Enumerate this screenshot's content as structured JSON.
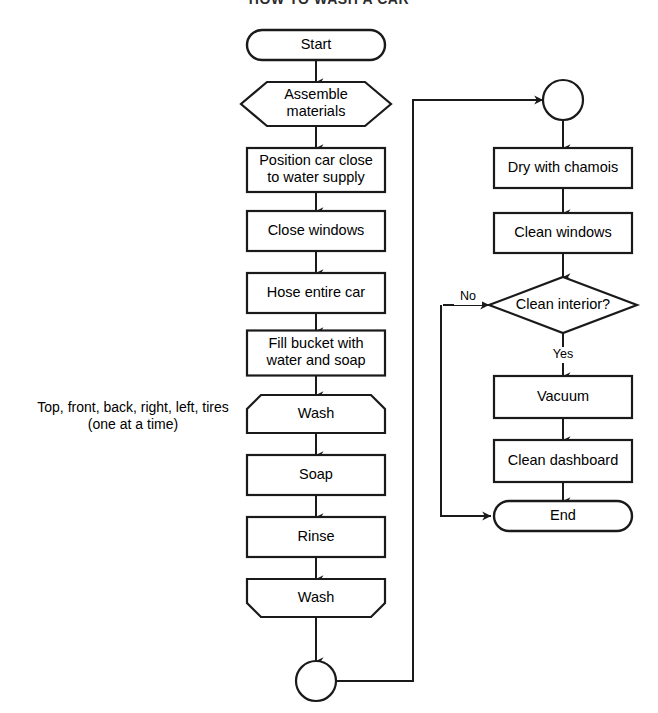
{
  "diagram": {
    "title": "HOW TO WASH A CAR",
    "title_x": 329,
    "title_y": 3,
    "canvas": {
      "width": 658,
      "height": 713
    },
    "stroke_color": "#1a1a1a",
    "fill_color": "#ffffff",
    "text_color": "#000000"
  },
  "annotation": {
    "line1": "Top, front, back, right, left, tires",
    "line2": "(one at a time)",
    "x": 133,
    "y1": 407,
    "y2": 424
  },
  "nodes": [
    {
      "id": "start",
      "type": "terminator",
      "label": "Start",
      "cx": 316,
      "cy": 45,
      "w": 138,
      "h": 30
    },
    {
      "id": "assemble",
      "type": "hexagon",
      "label": "Assemble|materials",
      "cx": 316,
      "cy": 104,
      "w": 150,
      "h": 44
    },
    {
      "id": "position",
      "type": "process",
      "label": "Position car close|to water supply",
      "cx": 316,
      "cy": 170,
      "w": 138,
      "h": 44
    },
    {
      "id": "closewin",
      "type": "process",
      "label": "Close windows",
      "cx": 316,
      "cy": 231,
      "w": 138,
      "h": 40
    },
    {
      "id": "hose",
      "type": "process",
      "label": "Hose entire car",
      "cx": 316,
      "cy": 293,
      "w": 138,
      "h": 40
    },
    {
      "id": "fillbucket",
      "type": "process",
      "label": "Fill bucket with|water and soap",
      "cx": 316,
      "cy": 353,
      "w": 138,
      "h": 45
    },
    {
      "id": "wash1",
      "type": "chamfer-top",
      "label": "Wash",
      "cx": 316,
      "cy": 414,
      "w": 138,
      "h": 38
    },
    {
      "id": "soap",
      "type": "process",
      "label": "Soap",
      "cx": 316,
      "cy": 475,
      "w": 138,
      "h": 40
    },
    {
      "id": "rinse",
      "type": "process",
      "label": "Rinse",
      "cx": 316,
      "cy": 537,
      "w": 138,
      "h": 40
    },
    {
      "id": "wash2",
      "type": "chamfer-bot",
      "label": "Wash",
      "cx": 316,
      "cy": 598,
      "w": 138,
      "h": 38
    },
    {
      "id": "connA",
      "type": "connector",
      "label": "",
      "cx": 316,
      "cy": 681,
      "w": 40,
      "h": 40
    },
    {
      "id": "connB",
      "type": "connector",
      "label": "",
      "cx": 563,
      "cy": 100,
      "w": 40,
      "h": 40
    },
    {
      "id": "drychamois",
      "type": "process",
      "label": "Dry with chamois",
      "cx": 563,
      "cy": 168,
      "w": 138,
      "h": 40
    },
    {
      "id": "cleanwin",
      "type": "process",
      "label": "Clean windows",
      "cx": 563,
      "cy": 233,
      "w": 138,
      "h": 40
    },
    {
      "id": "cleanint",
      "type": "decision",
      "label": "Clean interior?",
      "cx": 563,
      "cy": 305,
      "w": 148,
      "h": 56
    },
    {
      "id": "vacuum",
      "type": "process",
      "label": "Vacuum",
      "cx": 563,
      "cy": 397,
      "w": 138,
      "h": 42
    },
    {
      "id": "cleandash",
      "type": "process",
      "label": "Clean dashboard",
      "cx": 563,
      "cy": 461,
      "w": 138,
      "h": 42
    },
    {
      "id": "end",
      "type": "terminator",
      "label": "End",
      "cx": 563,
      "cy": 516,
      "w": 138,
      "h": 30
    }
  ],
  "edges": [
    {
      "id": "e-start-assemble",
      "from": "start",
      "to": "assemble",
      "points": "316,60 316,82",
      "arrow": "down",
      "label": ""
    },
    {
      "id": "e-assemble-position",
      "from": "assemble",
      "to": "position",
      "points": "316,126 316,148",
      "arrow": "down",
      "label": ""
    },
    {
      "id": "e-position-closewin",
      "from": "position",
      "to": "closewin",
      "points": "316,192 316,211",
      "arrow": "down",
      "label": ""
    },
    {
      "id": "e-closewin-hose",
      "from": "closewin",
      "to": "hose",
      "points": "316,251 316,273",
      "arrow": "down",
      "label": ""
    },
    {
      "id": "e-hose-fillbucket",
      "from": "hose",
      "to": "fillbucket",
      "points": "316,313 316,331",
      "arrow": "down",
      "label": ""
    },
    {
      "id": "e-fillbucket-wash1",
      "from": "fillbucket",
      "to": "wash1",
      "points": "316,376 316,395",
      "arrow": "down",
      "label": ""
    },
    {
      "id": "e-wash1-soap",
      "from": "wash1",
      "to": "soap",
      "points": "316,433 316,455",
      "arrow": "down",
      "label": ""
    },
    {
      "id": "e-soap-rinse",
      "from": "soap",
      "to": "rinse",
      "points": "316,495 316,517",
      "arrow": "down",
      "label": ""
    },
    {
      "id": "e-rinse-wash2",
      "from": "rinse",
      "to": "wash2",
      "points": "316,557 316,579",
      "arrow": "down",
      "label": ""
    },
    {
      "id": "e-wash2-connA",
      "from": "wash2",
      "to": "connA",
      "points": "316,617 316,661",
      "arrow": "down",
      "label": ""
    },
    {
      "id": "e-connA-connB",
      "from": "connA",
      "to": "connB",
      "points": "336,681 413,681 413,100 543,100",
      "arrow": "right",
      "label": ""
    },
    {
      "id": "e-connB-drychamois",
      "from": "connB",
      "to": "drychamois",
      "points": "563,120 563,148",
      "arrow": "down",
      "label": ""
    },
    {
      "id": "e-drychamois-cleanwin",
      "from": "drychamois",
      "to": "cleanwin",
      "points": "563,188 563,213",
      "arrow": "down",
      "label": ""
    },
    {
      "id": "e-cleanwin-cleanint",
      "from": "cleanwin",
      "to": "cleanint",
      "points": "563,253 563,277",
      "arrow": "down",
      "label": ""
    },
    {
      "id": "e-cleanint-vacuum",
      "from": "cleanint",
      "to": "vacuum",
      "points": "563,333 563,376",
      "arrow": "down",
      "label": "Yes",
      "label_x": 563,
      "label_y": 355
    },
    {
      "id": "e-cleanint-end",
      "from": "cleanint",
      "to": "end",
      "points": "489,305 441,305 441,516 487,516",
      "arrow": "right-then-path",
      "label": "No",
      "label_x": 468,
      "label_y": 297
    },
    {
      "id": "e-vacuum-cleandash",
      "from": "vacuum",
      "to": "cleandash",
      "points": "563,418 563,440",
      "arrow": "down",
      "label": ""
    },
    {
      "id": "e-cleandash-end",
      "from": "cleandash",
      "to": "end",
      "points": "563,482 563,501",
      "arrow": "down",
      "label": ""
    }
  ],
  "no_branch": {
    "arrow_head_x": 443,
    "arrow_head_y": 305,
    "tail_start_x": 489,
    "down_x": 441,
    "end_join_y": 516,
    "end_arrow_x": 491
  }
}
